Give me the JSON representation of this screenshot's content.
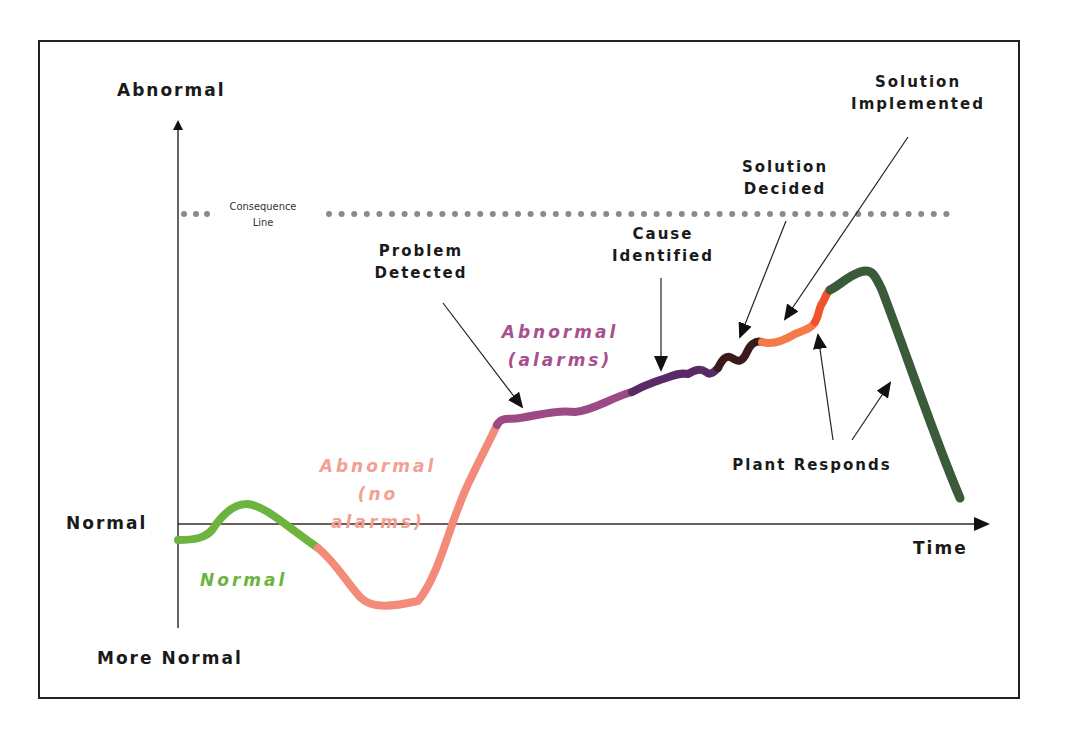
{
  "diagram": {
    "axes": {
      "y_top_label": "Abnormal",
      "y_mid_label": "Normal",
      "y_bottom_label": "More Normal",
      "x_label": "Time"
    },
    "consequence_line": {
      "label_line1": "Consequence",
      "label_line2": "Line",
      "color": "#8a8a8a"
    },
    "regions": [
      {
        "id": "normal",
        "line1": "Normal",
        "line2": "",
        "line3": "",
        "color": "#6db33f"
      },
      {
        "id": "abnormal-no-alarms",
        "line1": "Abnormal",
        "line2": "(no",
        "line3": "alarms)",
        "color": "#f28b7a"
      },
      {
        "id": "abnormal-alarms",
        "line1": "Abnormal",
        "line2": "(alarms)",
        "line3": "",
        "color": "#9c4a86"
      }
    ],
    "events": [
      {
        "id": "problem-detected",
        "line1": "Problem",
        "line2": "Detected"
      },
      {
        "id": "cause-identified",
        "line1": "Cause",
        "line2": "Identified"
      },
      {
        "id": "solution-decided",
        "line1": "Solution",
        "line2": "Decided"
      },
      {
        "id": "solution-implemented",
        "line1": "Solution",
        "line2": "Implemented"
      },
      {
        "id": "plant-responds",
        "line1": "Plant Responds",
        "line2": ""
      }
    ],
    "segment_colors": {
      "normal": "#6db33f",
      "abnormal_no_alarms": "#f28b7a",
      "abnormal_alarms": "#9c4a86",
      "cause_identified": "#5a2a66",
      "solution_decided": "#3a1a1a",
      "solution_implemented": "#f47a48",
      "plant_responds_early": "#f0522e",
      "plant_responds": "#3a5a3a"
    }
  }
}
